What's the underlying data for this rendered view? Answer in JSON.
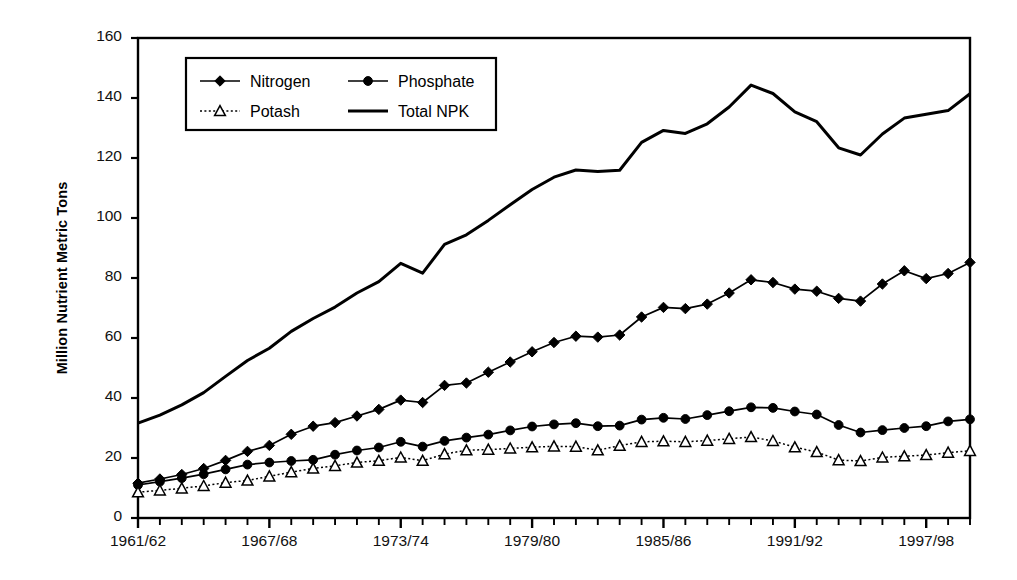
{
  "chart_data": {
    "type": "line",
    "title": "",
    "xlabel": "",
    "ylabel": "Million Nutrient Metric Tons",
    "ylim": [
      0,
      160
    ],
    "ytick_values": [
      0,
      20,
      40,
      60,
      80,
      100,
      120,
      140,
      160
    ],
    "ytick_labels": [
      "0",
      "20",
      "40",
      "60",
      "80",
      "100",
      "120",
      "140",
      "160"
    ],
    "grid": false,
    "legend_position": "upper-left-inside",
    "x": [
      "1961/62",
      "1962/63",
      "1963/64",
      "1964/65",
      "1965/66",
      "1966/67",
      "1967/68",
      "1968/69",
      "1969/70",
      "1970/71",
      "1971/72",
      "1972/73",
      "1973/74",
      "1974/75",
      "1975/76",
      "1976/77",
      "1977/78",
      "1978/79",
      "1979/80",
      "1980/81",
      "1981/82",
      "1982/83",
      "1983/84",
      "1984/85",
      "1985/86",
      "1986/87",
      "1987/88",
      "1988/89",
      "1989/90",
      "1990/91",
      "1991/92",
      "1992/93",
      "1993/94",
      "1994/95",
      "1995/96",
      "1996/97",
      "1997/98",
      "1998/99",
      "1999/00"
    ],
    "xtick_labels_shown": [
      "1961/62",
      "1967/68",
      "1973/74",
      "1979/80",
      "1985/86",
      "1991/92",
      "1997/98"
    ],
    "xtick_label_indices": [
      0,
      6,
      12,
      18,
      24,
      30,
      36
    ],
    "series": [
      {
        "name": "Nitrogen",
        "marker": "filled-diamond",
        "line": "solid",
        "values": [
          11.6,
          13.0,
          14.5,
          16.5,
          19.2,
          22.2,
          24.2,
          27.9,
          30.6,
          31.8,
          34.0,
          36.2,
          39.3,
          38.5,
          44.2,
          45.0,
          48.6,
          52.0,
          55.4,
          58.5,
          60.6,
          60.3,
          61.0,
          67.0,
          70.2,
          69.8,
          71.3,
          75.0,
          79.4,
          78.5,
          76.3,
          75.6,
          73.2,
          72.3,
          78.0,
          82.4,
          79.8,
          81.5,
          85.2
        ]
      },
      {
        "name": "Phosphate",
        "marker": "filled-circle",
        "line": "solid",
        "values": [
          11.0,
          12.1,
          13.3,
          14.6,
          16.2,
          17.8,
          18.5,
          19.0,
          19.4,
          21.1,
          22.5,
          23.5,
          25.4,
          23.8,
          25.7,
          26.8,
          27.8,
          29.2,
          30.5,
          31.2,
          31.6,
          30.6,
          30.8,
          32.8,
          33.4,
          33.0,
          34.3,
          35.6,
          36.9,
          36.7,
          35.5,
          34.5,
          31.0,
          28.5,
          29.3,
          30.0,
          30.6,
          32.2,
          32.9
        ]
      },
      {
        "name": "Potash",
        "marker": "open-triangle",
        "line": "dotted",
        "values": [
          8.6,
          9.2,
          9.9,
          10.7,
          11.8,
          12.5,
          13.9,
          15.3,
          16.5,
          17.4,
          18.5,
          19.1,
          20.2,
          19.1,
          21.3,
          22.6,
          22.8,
          23.2,
          23.6,
          23.9,
          23.8,
          22.6,
          24.1,
          25.4,
          25.6,
          25.4,
          25.8,
          26.4,
          27.0,
          25.7,
          23.6,
          22.0,
          19.3,
          19.0,
          20.2,
          20.6,
          21.0,
          21.8,
          22.4
        ]
      },
      {
        "name": "Total NPK",
        "marker": "none",
        "line": "solid-thick",
        "values": [
          31.6,
          34.3,
          37.7,
          41.8,
          47.2,
          52.5,
          56.6,
          62.2,
          66.5,
          70.3,
          75.0,
          78.8,
          84.9,
          81.6,
          91.2,
          94.4,
          99.2,
          104.4,
          109.5,
          113.6,
          116.0,
          115.5,
          115.9,
          125.2,
          129.2,
          128.2,
          131.4,
          137.0,
          144.3,
          141.5,
          135.4,
          132.1,
          123.4,
          121.0,
          128.0,
          133.3,
          134.6,
          135.8,
          141.4
        ]
      }
    ],
    "legend": [
      {
        "label": "Nitrogen",
        "marker": "filled-diamond"
      },
      {
        "label": "Phosphate",
        "marker": "filled-circle"
      },
      {
        "label": "Potash",
        "marker": "open-triangle"
      },
      {
        "label": "Total NPK",
        "marker": "none"
      }
    ],
    "colors": {
      "line": "#000000",
      "axis": "#000000",
      "background": "#ffffff"
    }
  }
}
